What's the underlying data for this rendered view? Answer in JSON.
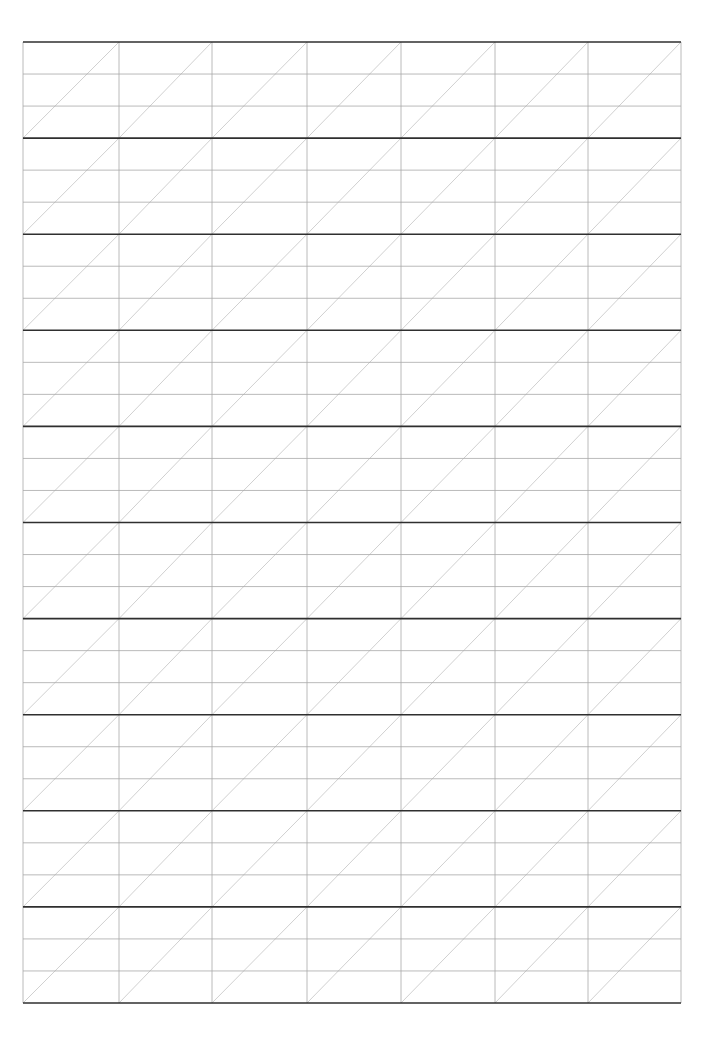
{
  "page": {
    "type": "handwriting-practice-grid",
    "background": "#ffffff"
  },
  "grid": {
    "left": 23,
    "top": 42,
    "right": 681,
    "bottom": 1003,
    "columns": 7,
    "bands": 10,
    "subrows_per_band": 3,
    "column_x": [
      23,
      119,
      212,
      307,
      401,
      495,
      588,
      681
    ],
    "colors": {
      "band_line": "#2f2f2f",
      "sub_line": "#a8a8a8",
      "vertical_line": "#a8a8a8",
      "diagonal_line": "#c4c4c4"
    },
    "stroke_widths": {
      "band_line": 1.6,
      "sub_line": 0.8,
      "vertical_line": 0.8,
      "diagonal_line": 0.8
    }
  }
}
